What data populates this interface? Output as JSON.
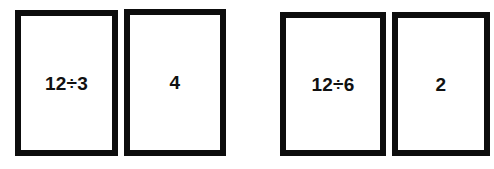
{
  "page": {
    "background_color": "#ffffff",
    "card_border_color": "#0d0d0d",
    "card_fill_color": "#ffffff",
    "text_color": "#111111"
  },
  "pairs": [
    {
      "name": "pair-1",
      "problem": {
        "label": "12÷3",
        "dividend": 12,
        "divisor": 3
      },
      "answer": {
        "label": "4",
        "value": 4
      }
    },
    {
      "name": "pair-2",
      "problem": {
        "label": "12÷6",
        "dividend": 12,
        "divisor": 6
      },
      "answer": {
        "label": "2",
        "value": 2
      }
    }
  ]
}
